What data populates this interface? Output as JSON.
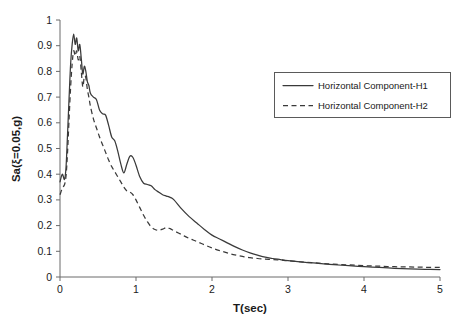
{
  "chart_data": {
    "type": "line",
    "title": "",
    "xlabel": "T(sec)",
    "ylabel": "Sa(ξ=0.05,g)",
    "xlim": [
      0,
      5
    ],
    "ylim": [
      0,
      1
    ],
    "grid": false,
    "legend_position": "upper-right",
    "xticks": [
      "0",
      "1",
      "2",
      "3",
      "4",
      "5"
    ],
    "xtick_values": [
      0,
      1,
      2,
      3,
      4,
      5
    ],
    "yticks": [
      "0",
      "0.1",
      "0.2",
      "0.3",
      "0.4",
      "0.5",
      "0.6",
      "0.7",
      "0.8",
      "0.9",
      "1"
    ],
    "ytick_values": [
      0,
      0.1,
      0.2,
      0.3,
      0.4,
      0.5,
      0.6,
      0.7,
      0.8,
      0.9,
      1.0
    ],
    "x": [
      0.0,
      0.03,
      0.06,
      0.08,
      0.1,
      0.12,
      0.14,
      0.16,
      0.18,
      0.2,
      0.22,
      0.24,
      0.26,
      0.28,
      0.3,
      0.32,
      0.34,
      0.36,
      0.38,
      0.4,
      0.44,
      0.48,
      0.52,
      0.56,
      0.6,
      0.64,
      0.68,
      0.72,
      0.76,
      0.8,
      0.84,
      0.88,
      0.92,
      0.96,
      1.0,
      1.05,
      1.1,
      1.15,
      1.2,
      1.25,
      1.3,
      1.35,
      1.4,
      1.45,
      1.5,
      1.6,
      1.7,
      1.8,
      1.9,
      2.0,
      2.1,
      2.2,
      2.3,
      2.4,
      2.5,
      2.6,
      2.7,
      2.8,
      2.9,
      3.0,
      3.2,
      3.4,
      3.6,
      3.8,
      4.0,
      4.2,
      4.4,
      4.6,
      4.8,
      5.0
    ],
    "series": [
      {
        "name": "Horizontal Component-H1",
        "style": "solid",
        "color": "#3a3a3a",
        "values": [
          0.37,
          0.4,
          0.38,
          0.43,
          0.56,
          0.7,
          0.83,
          0.905,
          0.945,
          0.905,
          0.93,
          0.88,
          0.905,
          0.85,
          0.79,
          0.82,
          0.8,
          0.76,
          0.745,
          0.715,
          0.7,
          0.69,
          0.65,
          0.635,
          0.63,
          0.59,
          0.545,
          0.53,
          0.49,
          0.44,
          0.405,
          0.44,
          0.47,
          0.465,
          0.435,
          0.39,
          0.365,
          0.36,
          0.355,
          0.34,
          0.33,
          0.32,
          0.315,
          0.31,
          0.3,
          0.265,
          0.235,
          0.21,
          0.185,
          0.163,
          0.148,
          0.133,
          0.118,
          0.105,
          0.094,
          0.085,
          0.077,
          0.072,
          0.068,
          0.064,
          0.058,
          0.053,
          0.048,
          0.044,
          0.04,
          0.037,
          0.034,
          0.032,
          0.03,
          0.029
        ]
      },
      {
        "name": "Horizontal Component-H2",
        "style": "dashed",
        "color": "#3a3a3a",
        "values": [
          0.32,
          0.345,
          0.36,
          0.395,
          0.49,
          0.62,
          0.74,
          0.83,
          0.88,
          0.86,
          0.88,
          0.845,
          0.86,
          0.8,
          0.74,
          0.78,
          0.775,
          0.73,
          0.7,
          0.665,
          0.615,
          0.58,
          0.545,
          0.515,
          0.485,
          0.455,
          0.43,
          0.41,
          0.39,
          0.37,
          0.35,
          0.335,
          0.33,
          0.32,
          0.3,
          0.27,
          0.24,
          0.215,
          0.195,
          0.185,
          0.182,
          0.186,
          0.192,
          0.188,
          0.18,
          0.165,
          0.15,
          0.138,
          0.125,
          0.113,
          0.103,
          0.094,
          0.086,
          0.08,
          0.075,
          0.072,
          0.07,
          0.068,
          0.066,
          0.063,
          0.058,
          0.054,
          0.05,
          0.047,
          0.044,
          0.042,
          0.04,
          0.039,
          0.038,
          0.037
        ]
      }
    ]
  },
  "legend": {
    "items": [
      {
        "label": "Horizontal Component-H1",
        "style": "solid"
      },
      {
        "label": "Horizontal Component-H2",
        "style": "dashed"
      }
    ]
  }
}
